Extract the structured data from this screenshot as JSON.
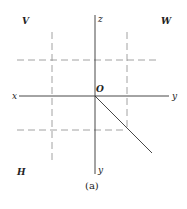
{
  "diagram": {
    "quadrant_labels": {
      "top_left": "V",
      "top_right": "W",
      "bottom_left": "H"
    },
    "axis_labels": {
      "left": "x",
      "right": "y",
      "top": "z",
      "bottom": "y"
    },
    "origin_label": "O",
    "caption": "(a)",
    "colors": {
      "line": "#333333",
      "dashed": "#888888",
      "background": "#ffffff"
    }
  }
}
